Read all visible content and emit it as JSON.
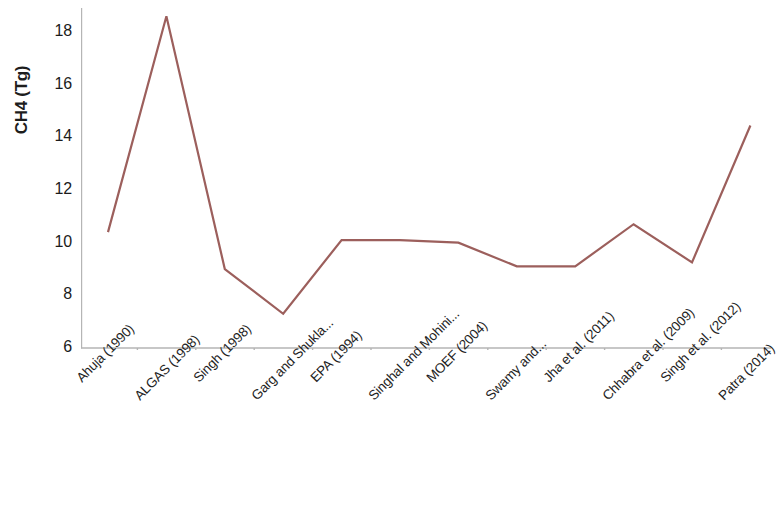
{
  "chart_data": {
    "type": "line",
    "title": "",
    "subtitle": "",
    "xlabel": "",
    "ylabel": "CH4 (Tg)",
    "categories": [
      "Ahuja (1990)",
      "ALGAS (1998)",
      "Singh (1998)",
      "Garg and Shukla...",
      "EPA (1994)",
      "Singhal and Mohini...",
      "MOEF (2004)",
      "Swamy and...",
      "Jha et al. (2011)",
      "Chhabra et al. (2009)",
      "Singh et al. (2012)",
      "Patra (2014)"
    ],
    "values": [
      10.4,
      18.6,
      9.0,
      7.3,
      10.1,
      10.1,
      10.0,
      9.1,
      9.1,
      10.7,
      9.25,
      14.45
    ],
    "series": [
      {
        "name": "CH4 emission estimate",
        "values": [
          10.4,
          18.6,
          9.0,
          7.3,
          10.1,
          10.1,
          10.0,
          9.1,
          9.1,
          10.7,
          9.25,
          14.45
        ],
        "color": "#9c5f5c"
      }
    ],
    "ylim": [
      6,
      18.9
    ],
    "y_ticks": [
      6,
      8,
      10,
      12,
      14,
      16,
      18
    ],
    "y_tick_labels": [
      "6",
      "8",
      "10",
      "12",
      "14",
      "16",
      "18"
    ],
    "grid": false,
    "legend": null,
    "legend_position": "none",
    "axis_color": "#b5b5b5",
    "line_color": "#9c5f5c",
    "line_width": 2.2,
    "markers": false,
    "background": "#ffffff"
  }
}
